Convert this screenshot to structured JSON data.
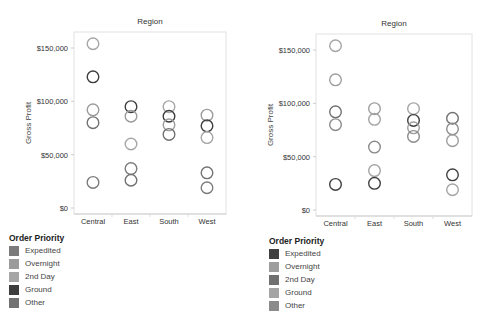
{
  "chart_data": [
    {
      "type": "scatter",
      "title": "Region",
      "xlabel": "",
      "ylabel": "Gross Profit",
      "categories": [
        "Central",
        "East",
        "South",
        "West"
      ],
      "ylim": [
        0,
        160000
      ],
      "yticks": [
        0,
        50000,
        100000,
        150000
      ],
      "ytick_labels": [
        "$0",
        "$50,000",
        "$100,000",
        "$150,000"
      ],
      "grid": false,
      "marker": "open-circle",
      "legend": {
        "title": "Order Priority",
        "position": "bottom-left",
        "entries": [
          {
            "label": "Expedited",
            "color": "#7b7b7b"
          },
          {
            "label": "Overnight",
            "color": "#9b9b9b"
          },
          {
            "label": "2nd Day",
            "color": "#a6a6a6"
          },
          {
            "label": "Ground",
            "color": "#3d3d3d"
          },
          {
            "label": "Other",
            "color": "#727272"
          }
        ]
      },
      "points": [
        {
          "category": "Central",
          "value": 154000,
          "series": "2nd Day"
        },
        {
          "category": "Central",
          "value": 123000,
          "series": "Ground"
        },
        {
          "category": "Central",
          "value": 92000,
          "series": "Overnight"
        },
        {
          "category": "Central",
          "value": 80000,
          "series": "Other"
        },
        {
          "category": "Central",
          "value": 24000,
          "series": "Expedited"
        },
        {
          "category": "East",
          "value": 95000,
          "series": "Ground"
        },
        {
          "category": "East",
          "value": 86000,
          "series": "Overnight"
        },
        {
          "category": "East",
          "value": 60000,
          "series": "2nd Day"
        },
        {
          "category": "East",
          "value": 37000,
          "series": "Expedited"
        },
        {
          "category": "East",
          "value": 26000,
          "series": "Other"
        },
        {
          "category": "South",
          "value": 95000,
          "series": "2nd Day"
        },
        {
          "category": "South",
          "value": 86000,
          "series": "Ground"
        },
        {
          "category": "South",
          "value": 78000,
          "series": "Overnight"
        },
        {
          "category": "South",
          "value": 69000,
          "series": "Other"
        },
        {
          "category": "West",
          "value": 87000,
          "series": "Overnight"
        },
        {
          "category": "West",
          "value": 77000,
          "series": "Ground"
        },
        {
          "category": "West",
          "value": 66000,
          "series": "2nd Day"
        },
        {
          "category": "West",
          "value": 33000,
          "series": "Other"
        },
        {
          "category": "West",
          "value": 19000,
          "series": "Expedited"
        }
      ]
    },
    {
      "type": "scatter",
      "title": "Region",
      "xlabel": "",
      "ylabel": "Gross Profit",
      "categories": [
        "Central",
        "East",
        "South",
        "West"
      ],
      "ylim": [
        0,
        160000
      ],
      "yticks": [
        0,
        50000,
        100000,
        150000
      ],
      "ytick_labels": [
        "$0",
        "$50,000",
        "$100,000",
        "$150,000"
      ],
      "grid": false,
      "marker": "open-circle",
      "legend": {
        "title": "Order Priority",
        "position": "bottom-left",
        "entries": [
          {
            "label": "Expedited",
            "color": "#404040"
          },
          {
            "label": "Overnight",
            "color": "#9d9d9d"
          },
          {
            "label": "2nd Day",
            "color": "#707070"
          },
          {
            "label": "Ground",
            "color": "#a4a4a4"
          },
          {
            "label": "Other",
            "color": "#8b8b8b"
          }
        ]
      },
      "points": [
        {
          "category": "Central",
          "value": 154000,
          "series": "Ground"
        },
        {
          "category": "Central",
          "value": 122000,
          "series": "Overnight"
        },
        {
          "category": "Central",
          "value": 92000,
          "series": "2nd Day"
        },
        {
          "category": "Central",
          "value": 80000,
          "series": "Other"
        },
        {
          "category": "Central",
          "value": 24000,
          "series": "Expedited"
        },
        {
          "category": "East",
          "value": 95000,
          "series": "Overnight"
        },
        {
          "category": "East",
          "value": 85000,
          "series": "Ground"
        },
        {
          "category": "East",
          "value": 59000,
          "series": "Other"
        },
        {
          "category": "East",
          "value": 37000,
          "series": "Ground"
        },
        {
          "category": "East",
          "value": 25000,
          "series": "Expedited"
        },
        {
          "category": "South",
          "value": 95000,
          "series": "Ground"
        },
        {
          "category": "South",
          "value": 84000,
          "series": "Expedited"
        },
        {
          "category": "South",
          "value": 77000,
          "series": "Overnight"
        },
        {
          "category": "South",
          "value": 69000,
          "series": "Other"
        },
        {
          "category": "West",
          "value": 86000,
          "series": "2nd Day"
        },
        {
          "category": "West",
          "value": 76000,
          "series": "Other"
        },
        {
          "category": "West",
          "value": 65000,
          "series": "Overnight"
        },
        {
          "category": "West",
          "value": 33000,
          "series": "Expedited"
        },
        {
          "category": "West",
          "value": 19000,
          "series": "Ground"
        }
      ]
    }
  ]
}
